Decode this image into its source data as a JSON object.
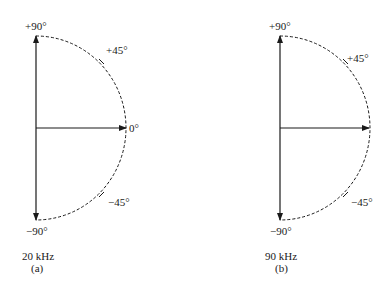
{
  "diagrams": [
    {
      "id": "a",
      "labels": {
        "top": "+90°",
        "plus45": "+45°",
        "zero": "0°",
        "minus45": "−45°",
        "bottom": "−90°"
      },
      "frequency": "20 kHz",
      "caption": "(a)"
    },
    {
      "id": "b",
      "labels": {
        "top": "+90°",
        "plus45": "+45°",
        "minus45": "−45°",
        "bottom": "−90°"
      },
      "frequency": "90 kHz",
      "caption": "(b)"
    }
  ]
}
